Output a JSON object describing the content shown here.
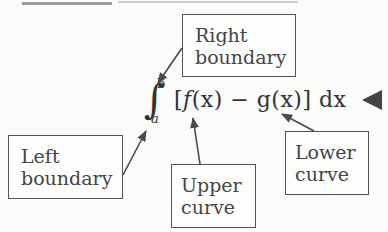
{
  "formula": {
    "integral_symbol": "∫",
    "upper_limit": "b",
    "lower_limit": "a",
    "open_bracket": "[",
    "upper_fn": "f",
    "upper_arg": "(x)",
    "operator": " − ",
    "lower_fn": "g",
    "lower_arg": "(x)",
    "close_bracket": "]",
    "differential": " dx"
  },
  "labels": {
    "right_boundary": {
      "line1": "Right",
      "line2": "boundary"
    },
    "left_boundary": {
      "line1": "Left",
      "line2": "boundary"
    },
    "upper_curve": {
      "line1": "Upper",
      "line2": "curve"
    },
    "lower_curve": {
      "line1": "Lower",
      "line2": "curve"
    }
  },
  "colors": {
    "background": "#fbfbfa",
    "ink": "#3a3a3a",
    "arrow": "#4a4a4a"
  }
}
